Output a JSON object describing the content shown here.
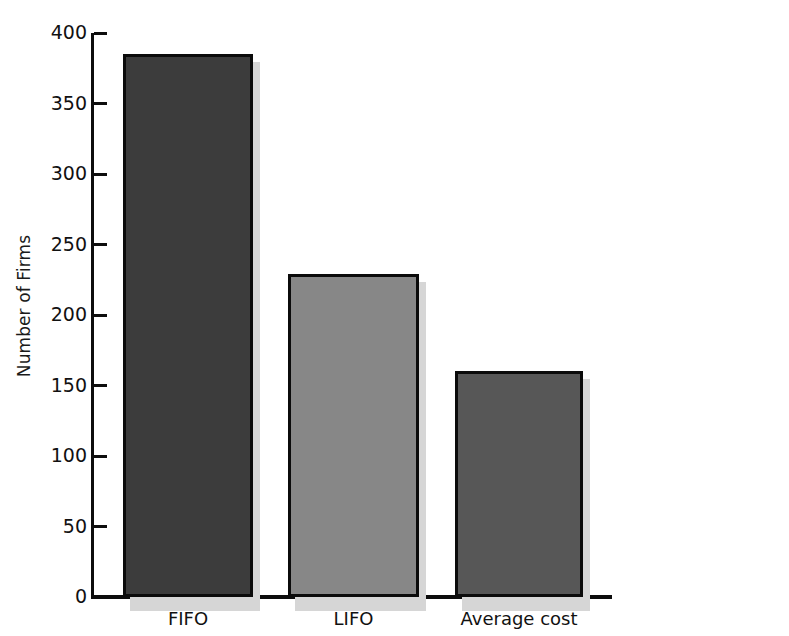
{
  "chart_data": {
    "type": "bar",
    "title": "",
    "subtitle": "",
    "xlabel": "",
    "ylabel": "Number of Firms",
    "categories": [
      "FIFO",
      "LIFO",
      "Average cost"
    ],
    "values": [
      385,
      229,
      160
    ],
    "series": [
      {
        "name": "Number of Firms",
        "values": [
          385,
          229,
          160
        ]
      }
    ],
    "ylim": [
      0,
      400
    ],
    "yticks": [
      0,
      50,
      100,
      150,
      200,
      250,
      300,
      350,
      400
    ],
    "ytick_labels": [
      "0",
      "50",
      "100",
      "150",
      "200",
      "250",
      "300",
      "350",
      "400"
    ],
    "grid": false,
    "legend": false,
    "legend_position": "none",
    "annotations": [],
    "bar_colors": [
      "#3c3c3c",
      "#878787",
      "#575757"
    ],
    "bar_edge_color": "#0b0b0b",
    "shadow_color": "#d6d6d6",
    "axis_color": "#0d0d0d",
    "background_color": "#ffffff"
  },
  "axis": {
    "y_title": "Number of Firms"
  }
}
